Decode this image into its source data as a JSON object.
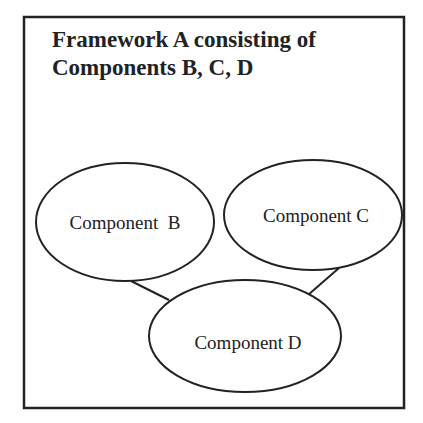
{
  "diagram": {
    "title_line1": "Framework A consisting of",
    "title_line2": "Components B, C, D",
    "nodes": [
      {
        "id": "B",
        "label": "Component  B",
        "cx": 125,
        "cy": 222,
        "rx": 89,
        "ry": 59
      },
      {
        "id": "C",
        "label": "Component C",
        "cx": 313,
        "cy": 215,
        "rx": 89,
        "ry": 55
      },
      {
        "id": "D",
        "label": "Component D",
        "cx": 245,
        "cy": 336,
        "rx": 96,
        "ry": 56
      }
    ],
    "edges": [
      {
        "from": "B",
        "to": "D"
      },
      {
        "from": "C",
        "to": "D"
      }
    ],
    "colors": {
      "stroke": "#222222",
      "background": "#ffffff"
    }
  }
}
